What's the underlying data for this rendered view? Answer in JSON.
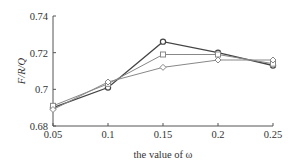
{
  "chart_data": {
    "type": "line",
    "title": "",
    "xlabel": "the value of ω",
    "ylabel": "F/R/Q",
    "x": [
      0.05,
      0.1,
      0.15,
      0.2,
      0.25
    ],
    "x_tick_labels": [
      "0.05",
      "0.1",
      "0.15",
      "0.2",
      "0.25"
    ],
    "y_tick_labels": [
      "0.74",
      "0.72",
      "0.7",
      "0.68"
    ],
    "y_ticks": [
      0.74,
      0.72,
      0.7,
      0.68
    ],
    "ylim": [
      0.68,
      0.74
    ],
    "xlim": [
      0.05,
      0.25
    ],
    "grid": false,
    "legend": "none",
    "series": [
      {
        "name": "series-1",
        "marker": "circle",
        "color": "#444444",
        "values": [
          0.69,
          0.701,
          0.726,
          0.72,
          0.713
        ]
      },
      {
        "name": "series-2",
        "marker": "square",
        "color": "#888888",
        "values": [
          0.691,
          0.703,
          0.719,
          0.719,
          0.714
        ]
      },
      {
        "name": "series-3",
        "marker": "diamond",
        "color": "#888888",
        "values": [
          0.689,
          0.704,
          0.712,
          0.716,
          0.716
        ]
      }
    ]
  }
}
